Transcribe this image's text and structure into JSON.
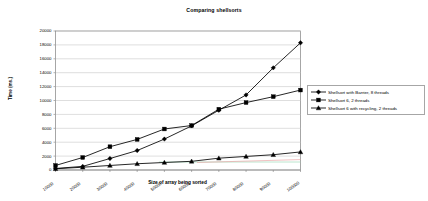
{
  "chart_data": {
    "type": "line",
    "title": "Comparing shellsorts",
    "xlabel": "Size of array being sorted",
    "ylabel": "Time (ms.)",
    "x": [
      10000,
      20000,
      30000,
      40000,
      50000,
      60000,
      70000,
      80000,
      90000,
      100000
    ],
    "xtick_labels": [
      "10000",
      "20000",
      "30000",
      "40000",
      "50000",
      "60000",
      "70000",
      "80000",
      "90000",
      "100000"
    ],
    "ytick_labels": [
      "0",
      "2000",
      "4000",
      "6000",
      "8000",
      "10000",
      "12000",
      "14000",
      "16000",
      "18000",
      "20000"
    ],
    "xlim": [
      10000,
      100000
    ],
    "ylim": [
      0,
      20000
    ],
    "ystep": 2000,
    "grid": "horizontal",
    "legend_position": "right",
    "series": [
      {
        "name": "Shellsort with Barrier, 8 threads",
        "marker": "diamond",
        "color": "#000000",
        "values": [
          220,
          520,
          1650,
          2800,
          4450,
          6350,
          8600,
          10800,
          14700,
          18300
        ]
      },
      {
        "name": "Shellsort 6, 2 threads",
        "marker": "square",
        "color": "#000000",
        "values": [
          650,
          1800,
          3350,
          4400,
          5900,
          6400,
          8750,
          9700,
          10550,
          11500
        ]
      },
      {
        "name": "Shellsort 6 with recycling, 2 threads",
        "marker": "triangle",
        "color": "#000000",
        "values": [
          180,
          400,
          650,
          900,
          1080,
          1250,
          1700,
          1950,
          2200,
          2600
        ]
      }
    ]
  }
}
